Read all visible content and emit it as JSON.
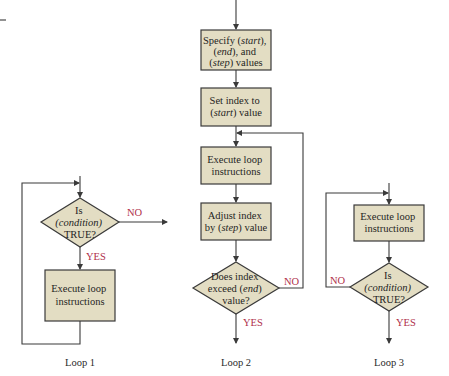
{
  "colors": {
    "node_fill": "#e3ddc3",
    "node_stroke": "#3a3a3a",
    "branch_label": "#b0304a",
    "text": "#1f1f1f"
  },
  "loop1": {
    "caption": "Loop 1",
    "decision": {
      "line1": "Is",
      "line2": "(condition)",
      "line3": "TRUE?"
    },
    "no_label": "NO",
    "yes_label": "YES",
    "process": {
      "line1": "Execute loop",
      "line2": "instructions"
    }
  },
  "loop2": {
    "caption": "Loop 2",
    "step1": {
      "line1": "Specify (",
      "italic1": "start",
      "line1b": "),",
      "line2a": "(",
      "italic2": "end",
      "line2b": "), and",
      "line3a": "(",
      "italic3": "step",
      "line3b": ") values"
    },
    "step2": {
      "line1": "Set index to",
      "line2a": "(",
      "italic2": "start",
      "line2b": ") value"
    },
    "step3": {
      "line1": "Execute loop",
      "line2": "instructions"
    },
    "step4": {
      "line1": "Adjust index",
      "line2a": "by (",
      "italic2": "step",
      "line2b": ") value"
    },
    "decision": {
      "line1": "Does index",
      "line2a": "exceed (",
      "italic2": "end",
      "line2b": ")",
      "line3": "value?"
    },
    "no_label": "NO",
    "yes_label": "YES"
  },
  "loop3": {
    "caption": "Loop 3",
    "process": {
      "line1": "Execute loop",
      "line2": "instructions"
    },
    "decision": {
      "line1": "Is",
      "line2": "(condition)",
      "line3": "TRUE?"
    },
    "no_label": "NO",
    "yes_label": "YES"
  }
}
